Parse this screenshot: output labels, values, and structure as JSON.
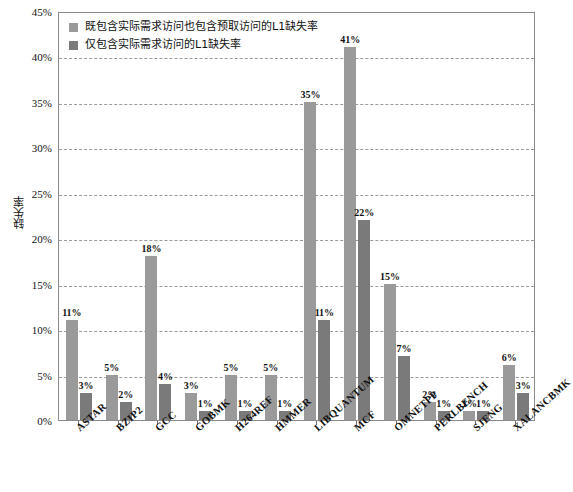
{
  "chart_data": {
    "type": "bar",
    "title": "",
    "xlabel": "",
    "ylabel": "缺失率",
    "ylim": [
      0,
      45
    ],
    "ytick_labels": [
      "0%",
      "5%",
      "10%",
      "15%",
      "20%",
      "25%",
      "30%",
      "35%",
      "40%",
      "45%"
    ],
    "ytick_values": [
      0,
      5,
      10,
      15,
      20,
      25,
      30,
      35,
      40,
      45
    ],
    "grid": true,
    "legend_position": "top-left",
    "categories": [
      "ASTAR",
      "BZIP2",
      "GCC",
      "GOBMK",
      "H264REF",
      "HMMER",
      "LIBQUANTUM",
      "MCF",
      "OMNETPP",
      "PERLBENCH",
      "SJENG",
      "XALANCBMK"
    ],
    "series": [
      {
        "name": "既包含实际需求访问也包含预取访问的L1缺失率",
        "color": "#9a9a9a",
        "values": [
          11,
          5,
          18,
          3,
          5,
          5,
          35,
          41,
          15,
          2,
          1,
          6
        ],
        "labels": [
          "11%",
          "5%",
          "18%",
          "3%",
          "5%",
          "5%",
          "35%",
          "41%",
          "15%",
          "2%",
          "1%",
          "6%"
        ]
      },
      {
        "name": "仅包含实际需求访问的L1缺失率",
        "color": "#7a7a7a",
        "values": [
          3,
          2,
          4,
          1,
          1,
          1,
          11,
          22,
          7,
          1,
          1,
          3
        ],
        "labels": [
          "3%",
          "2%",
          "4%",
          "1%",
          "1%",
          "1%",
          "11%",
          "22%",
          "7%",
          "1%",
          "1%",
          "3%"
        ]
      }
    ]
  },
  "legend": {
    "items": [
      {
        "label": "既包含实际需求访问也包含预取访问的L1缺失率",
        "color": "#9a9a9a"
      },
      {
        "label": "仅包含实际需求访问的L1缺失率",
        "color": "#7a7a7a"
      }
    ]
  },
  "axes": {
    "y_title": "缺失率"
  }
}
